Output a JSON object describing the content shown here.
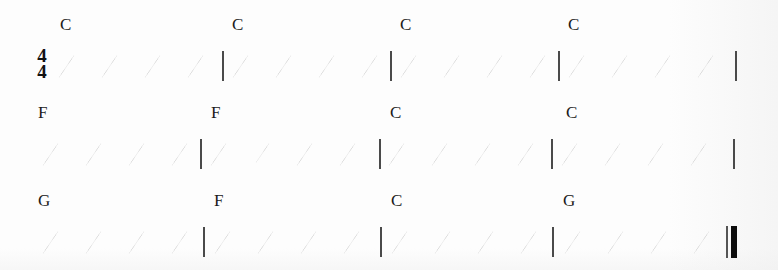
{
  "document": {
    "kind": "chord-rhythm-chart",
    "time_signature": {
      "numerator": "4",
      "denominator": "4"
    },
    "slash_glyph": "rhythm-slash",
    "beats_per_measure": 4,
    "colors": {
      "background": "#fdfdfd",
      "ink": "#1b1b1b",
      "barline": "#4a4a4a",
      "final_barline": "#0d0d0d"
    }
  },
  "systems": [
    {
      "index": 1,
      "has_time_signature": true,
      "measures": [
        {
          "chord": "C",
          "beats": [
            "/",
            "/",
            "/",
            "/"
          ]
        },
        {
          "chord": "C",
          "beats": [
            "/",
            "/",
            "/",
            "/"
          ]
        },
        {
          "chord": "C",
          "beats": [
            "/",
            "/",
            "/",
            "/"
          ]
        },
        {
          "chord": "C",
          "beats": [
            "/",
            "/",
            "/",
            "/"
          ]
        }
      ],
      "ending": "single-barline"
    },
    {
      "index": 2,
      "has_time_signature": false,
      "measures": [
        {
          "chord": "F",
          "beats": [
            "/",
            "/",
            "/",
            "/"
          ]
        },
        {
          "chord": "F",
          "beats": [
            "/",
            "/",
            "/",
            "/"
          ]
        },
        {
          "chord": "C",
          "beats": [
            "/",
            "/",
            "/",
            "/"
          ]
        },
        {
          "chord": "C",
          "beats": [
            "/",
            "/",
            "/",
            "/"
          ]
        }
      ],
      "ending": "single-barline"
    },
    {
      "index": 3,
      "has_time_signature": false,
      "measures": [
        {
          "chord": "G",
          "beats": [
            "/",
            "/",
            "/",
            "/"
          ]
        },
        {
          "chord": "F",
          "beats": [
            "/",
            "/",
            "/",
            "/"
          ]
        },
        {
          "chord": "C",
          "beats": [
            "/",
            "/",
            "/",
            "/"
          ]
        },
        {
          "chord": "G",
          "beats": [
            "/",
            "/",
            "/",
            "/"
          ]
        }
      ],
      "ending": "final-barline"
    }
  ],
  "layout": {
    "system_tops": [
      0,
      88,
      176
    ],
    "slash_rows_y": [
      53,
      139,
      227
    ],
    "chord_rows_y": [
      16,
      104,
      192
    ],
    "system_1": {
      "timesig_x": 33,
      "slash_x": [
        57,
        100,
        143,
        186,
        231,
        274,
        317,
        360,
        399,
        442,
        485,
        528,
        567,
        610,
        653,
        696
      ],
      "barline_x": [
        222,
        390,
        558,
        735
      ],
      "chord_x": [
        60,
        232,
        400,
        568
      ]
    },
    "system_2": {
      "slash_x": [
        41,
        84,
        127,
        170,
        209,
        252,
        295,
        338,
        387,
        430,
        473,
        516,
        560,
        603,
        646,
        689
      ],
      "barline_x": [
        200,
        379,
        551,
        733
      ],
      "chord_x": [
        38,
        211,
        390,
        566
      ]
    },
    "system_3": {
      "slash_x": [
        41,
        84,
        127,
        170,
        213,
        256,
        299,
        342,
        390,
        433,
        476,
        519,
        563,
        606,
        649,
        692
      ],
      "barline_x": [
        203,
        380,
        552,
        726
      ],
      "chord_x": [
        38,
        214,
        391,
        563
      ]
    }
  }
}
